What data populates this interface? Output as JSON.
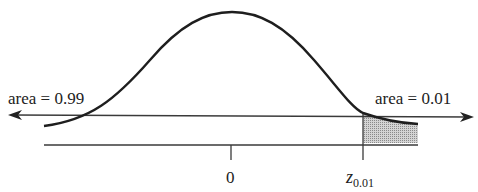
{
  "diagram": {
    "type": "normal-distribution-right-tail",
    "left_label": "area = 0.99",
    "right_label": "area = 0.01",
    "center_tick_label": "0",
    "critical_label_main": "z",
    "critical_label_sub": "0.01",
    "colors": {
      "curve": "#1e1e1e",
      "lines": "#3a3a3a",
      "shade": "#b8b8b8"
    }
  }
}
